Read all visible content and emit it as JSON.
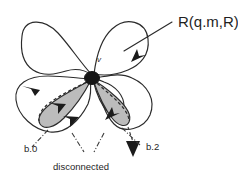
{
  "figure": {
    "background_color": "#ffffff",
    "stroke_color": "#2b2b2b",
    "shade_color": "#bcbcbc",
    "vertex_color": "#161616",
    "width": 238,
    "height": 181
  },
  "labels": {
    "relation": "R(q.m,R)",
    "vertex": "v",
    "branch_left": "b.0",
    "branch_right": "b.2",
    "caption": "disconnected"
  },
  "structure": {
    "vertex_count": 1,
    "loop_count": 5,
    "shaded_petal_count": 2,
    "arrowhead_count": 6
  }
}
